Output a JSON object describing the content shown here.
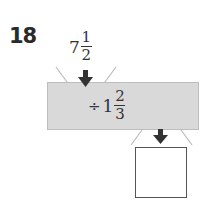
{
  "problem": {
    "number": "18",
    "input": {
      "whole": "7",
      "numerator": "1",
      "denominator": "2"
    },
    "rule": {
      "operator": "÷",
      "whole": "1",
      "numerator": "2",
      "denominator": "3"
    },
    "output": {
      "value": ""
    }
  },
  "colors": {
    "machine_fill": "#d9d9d9",
    "arrow": "#333333",
    "funnel_lines": "#bbbbbb"
  }
}
